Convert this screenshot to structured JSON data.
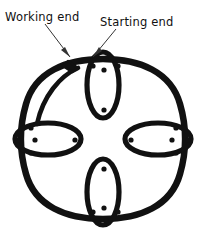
{
  "figure": {
    "kind": "knot-diagram",
    "background_color": "#ffffff",
    "ink_color": "#111111",
    "width": 205,
    "height": 240
  },
  "labels": [
    {
      "id": "working-end",
      "text": "Working end",
      "x": 5,
      "y": 21,
      "leader": {
        "x1": 45,
        "y1": 24,
        "x2": 70,
        "y2": 57
      }
    },
    {
      "id": "starting-end",
      "text": "Starting end",
      "x": 100,
      "y": 26,
      "leader": {
        "x1": 116,
        "y1": 29,
        "x2": 93,
        "y2": 57
      }
    }
  ],
  "knot": {
    "ring": {
      "description": "rounded square outer ring",
      "center_x": 103,
      "center_y": 139,
      "radius_x": 80,
      "radius_y": 80,
      "stroke_width": 6.5
    },
    "loops": [
      {
        "id": "top-loop",
        "cx": 103,
        "cy": 85,
        "rx": 16,
        "ry": 33
      },
      {
        "id": "bottom-loop",
        "cx": 103,
        "cy": 192,
        "rx": 16,
        "ry": 33
      },
      {
        "id": "left-loop",
        "cx": 48,
        "cy": 139,
        "rx": 33,
        "ry": 16
      },
      {
        "id": "right-loop",
        "cx": 158,
        "cy": 139,
        "rx": 33,
        "ry": 16
      }
    ],
    "working_end_arc": {
      "id": "working-end-strand",
      "description": "inner strand with arrow tip at upper left"
    },
    "dots": [
      {
        "x": 106,
        "y": 58
      },
      {
        "x": 93,
        "y": 66
      },
      {
        "x": 104,
        "y": 70
      },
      {
        "x": 118,
        "y": 66
      },
      {
        "x": 104,
        "y": 110
      },
      {
        "x": 106,
        "y": 221
      },
      {
        "x": 93,
        "y": 212
      },
      {
        "x": 104,
        "y": 208
      },
      {
        "x": 118,
        "y": 212
      },
      {
        "x": 104,
        "y": 169
      },
      {
        "x": 18,
        "y": 140
      },
      {
        "x": 31,
        "y": 128
      },
      {
        "x": 35,
        "y": 140
      },
      {
        "x": 31,
        "y": 153
      },
      {
        "x": 75,
        "y": 140
      },
      {
        "x": 188,
        "y": 140
      },
      {
        "x": 176,
        "y": 128
      },
      {
        "x": 172,
        "y": 140
      },
      {
        "x": 176,
        "y": 153
      },
      {
        "x": 131,
        "y": 140
      }
    ],
    "dot_radius": 2.6
  }
}
